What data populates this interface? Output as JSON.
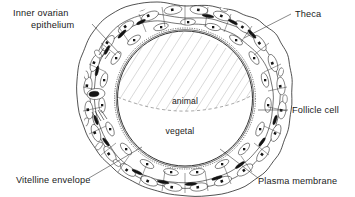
{
  "figure": {
    "background_color": "#ffffff",
    "line_color": "#1a1a1a",
    "hatch_color": "#b9b9b9",
    "text_color": "#1a1a1a",
    "width": 355,
    "height": 197
  },
  "callouts": [
    {
      "id": "inner-ovarian-epithelium",
      "line1": "Inner  ovarian",
      "line2": "epithelium",
      "anchor": "top-left"
    },
    {
      "id": "theca",
      "line1": "Theca",
      "line2": "",
      "anchor": "top-right"
    },
    {
      "id": "follicle-cell",
      "line1": "Follicle cell",
      "line2": "",
      "anchor": "right"
    },
    {
      "id": "vitelline-envelope",
      "line1": "Vitelline envelope",
      "line2": "",
      "anchor": "bottom-left"
    },
    {
      "id": "plasma-membrane",
      "line1": "Plasma membrane",
      "line2": "",
      "anchor": "bottom-right"
    }
  ],
  "labels": {
    "inner_ovarian_epithelium_line1": "Inner  ovarian",
    "inner_ovarian_epithelium_line2": "epithelium",
    "theca": "Theca",
    "follicle_cell": "Follicle cell",
    "vitelline_envelope": "Vitelline envelope",
    "plasma_membrane": "Plasma membrane"
  },
  "regions": {
    "animal_pole": "animal",
    "vegetal_pole": "vegetal"
  },
  "structure": {
    "oocyte_center_x": 185,
    "oocyte_center_y": 98,
    "oocyte_radius": 68,
    "layers": [
      "inner ovarian epithelium",
      "theca",
      "follicle cell layer",
      "vitelline envelope",
      "plasma membrane"
    ]
  }
}
